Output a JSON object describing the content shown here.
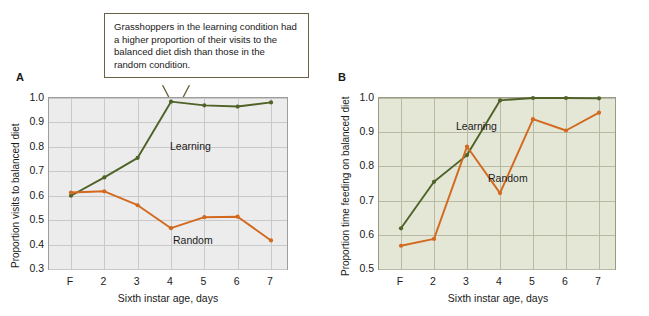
{
  "figure": {
    "background": "#ffffff",
    "series_colors": {
      "learning": "#4f6228",
      "random": "#d2691e"
    }
  },
  "panels": [
    {
      "letter": "A",
      "callout": "Grasshoppers in the learning condition had a higher proportion of their visits to the balanced diet dish than those in the random condition.",
      "chart_data": {
        "type": "line",
        "title": "",
        "xlabel": "Sixth instar age, days",
        "ylabel": "Proportion visits to balanced diet",
        "categories": [
          "F",
          "2",
          "3",
          "4",
          "5",
          "6",
          "7"
        ],
        "ylim": [
          0.3,
          1.0
        ],
        "yticks": [
          "0.3",
          "0.4",
          "0.5",
          "0.6",
          "0.7",
          "0.8",
          "0.9",
          "1.0"
        ],
        "grid": true,
        "legend_position": "inline-annotation",
        "plot_background": "#ececec",
        "series": [
          {
            "name": "Learning",
            "color": "#4f6228",
            "values": [
              0.6,
              0.675,
              0.755,
              0.985,
              0.97,
              0.965,
              0.982
            ]
          },
          {
            "name": "Random",
            "color": "#d2691e",
            "values": [
              0.613,
              0.618,
              0.561,
              0.467,
              0.512,
              0.514,
              0.417
            ]
          }
        ]
      }
    },
    {
      "letter": "B",
      "callout": "Grasshoppers in the random condition eventually also had a higher proportion of their visits to the balanced diet dish, but it took more trials for them to recognize the balanced diet.",
      "chart_data": {
        "type": "line",
        "title": "",
        "xlabel": "Sixth instar age, days",
        "ylabel": "Proportion time feeding on balanced diet",
        "categories": [
          "F",
          "2",
          "3",
          "4",
          "5",
          "6",
          "7"
        ],
        "ylim": [
          0.5,
          1.0
        ],
        "yticks": [
          "0.5",
          "0.6",
          "0.7",
          "0.8",
          "0.9",
          "1.0"
        ],
        "grid": true,
        "legend_position": "inline-annotation",
        "plot_background": "#e4e6d6",
        "series": [
          {
            "name": "Learning",
            "color": "#4f6228",
            "values": [
              0.619,
              0.755,
              0.833,
              0.993,
              1.0,
              1.0,
              0.999
            ]
          },
          {
            "name": "Random",
            "color": "#d2691e",
            "values": [
              0.568,
              0.588,
              0.858,
              0.722,
              0.938,
              0.905,
              0.957
            ]
          }
        ]
      }
    }
  ]
}
